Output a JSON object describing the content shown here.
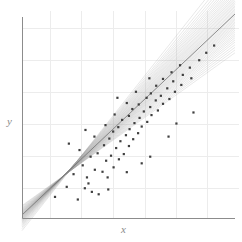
{
  "figure": {
    "background_color": "#ffffff",
    "width": 242,
    "height": 242
  },
  "axes": {
    "x_label": "x",
    "y_label": "y",
    "axis_color": "#8c8c8c",
    "axis_width": 1,
    "origin_px": [
      22,
      218
    ],
    "x_axis_end_px": [
      235,
      218
    ],
    "y_axis_top_px": [
      22,
      17
    ],
    "ticks_visible": false,
    "tick_labels_visible": false
  },
  "grid": {
    "visible": true,
    "color": "#ececec",
    "width": 1,
    "x_positions_px": [
      50,
      81,
      113,
      145,
      176,
      207
    ],
    "y_positions_px": [
      28,
      60,
      92,
      124,
      156,
      188
    ]
  },
  "chart_data": {
    "type": "scatter",
    "title": "",
    "subtitle": "",
    "xlabel": "x",
    "ylabel": "y",
    "xlim": [
      0,
      10
    ],
    "ylim": [
      0,
      10
    ],
    "grid": true,
    "legend": null,
    "annotations": [],
    "series": [
      {
        "name": "observations",
        "type": "scatter",
        "marker": "square",
        "marker_size_px": 2.2,
        "color": "#3f3f3f",
        "points": [
          [
            1.55,
            1.05
          ],
          [
            2.1,
            1.55
          ],
          [
            2.62,
            0.92
          ],
          [
            2.95,
            1.48
          ],
          [
            3.28,
            1.3
          ],
          [
            2.42,
            2.18
          ],
          [
            3.05,
            2.02
          ],
          [
            3.6,
            1.18
          ],
          [
            3.42,
            2.4
          ],
          [
            2.85,
            2.62
          ],
          [
            3.78,
            2.3
          ],
          [
            4.02,
            2.02
          ],
          [
            3.22,
            3.05
          ],
          [
            3.95,
            2.85
          ],
          [
            4.3,
            2.52
          ],
          [
            2.7,
            3.38
          ],
          [
            3.55,
            3.22
          ],
          [
            4.18,
            3.1
          ],
          [
            4.55,
            2.92
          ],
          [
            3.85,
            3.62
          ],
          [
            4.42,
            3.48
          ],
          [
            4.78,
            3.18
          ],
          [
            3.4,
            4.05
          ],
          [
            4.1,
            3.95
          ],
          [
            4.62,
            3.82
          ],
          [
            5.02,
            3.58
          ],
          [
            4.28,
            4.3
          ],
          [
            4.88,
            4.12
          ],
          [
            5.22,
            3.92
          ],
          [
            3.92,
            4.62
          ],
          [
            4.52,
            4.52
          ],
          [
            5.05,
            4.42
          ],
          [
            5.45,
            4.22
          ],
          [
            4.7,
            4.88
          ],
          [
            5.28,
            4.72
          ],
          [
            5.62,
            4.55
          ],
          [
            4.35,
            5.15
          ],
          [
            5.02,
            5.08
          ],
          [
            5.52,
            4.98
          ],
          [
            5.88,
            4.78
          ],
          [
            5.18,
            5.42
          ],
          [
            5.72,
            5.3
          ],
          [
            6.08,
            5.12
          ],
          [
            4.92,
            5.72
          ],
          [
            5.48,
            5.65
          ],
          [
            6.02,
            5.52
          ],
          [
            6.38,
            5.35
          ],
          [
            5.85,
            5.98
          ],
          [
            6.28,
            5.85
          ],
          [
            6.62,
            5.68
          ],
          [
            5.35,
            6.28
          ],
          [
            6.05,
            6.2
          ],
          [
            6.52,
            6.08
          ],
          [
            6.92,
            5.92
          ],
          [
            6.3,
            6.58
          ],
          [
            6.82,
            6.45
          ],
          [
            7.18,
            6.28
          ],
          [
            6.62,
            6.92
          ],
          [
            7.1,
            6.8
          ],
          [
            7.48,
            6.62
          ],
          [
            7.02,
            7.25
          ],
          [
            7.55,
            7.12
          ],
          [
            7.95,
            6.95
          ],
          [
            7.42,
            7.6
          ],
          [
            7.88,
            7.48
          ],
          [
            8.32,
            7.85
          ],
          [
            8.65,
            8.22
          ],
          [
            9.02,
            8.58
          ],
          [
            2.2,
            3.7
          ],
          [
            4.92,
            2.28
          ],
          [
            6.02,
            3.05
          ],
          [
            7.25,
            4.7
          ],
          [
            8.05,
            5.25
          ],
          [
            3.12,
            1.72
          ],
          [
            5.62,
            2.72
          ],
          [
            4.05,
            1.42
          ],
          [
            6.88,
            4.05
          ],
          [
            2.98,
            4.38
          ],
          [
            5.98,
            6.95
          ],
          [
            4.48,
            5.98
          ]
        ]
      },
      {
        "name": "posterior-regression-lines",
        "type": "line-bundle",
        "color": "#9a9a9a",
        "opacity": 0.38,
        "width": 0.6,
        "count": 44,
        "description": "Bundle of sampled regression lines converging near the lower-left and fanning out toward the upper right.",
        "pivot": [
          1.55,
          0.75
        ],
        "slopes": [
          0.76,
          0.778,
          0.795,
          0.812,
          0.828,
          0.842,
          0.856,
          0.868,
          0.88,
          0.892,
          0.903,
          0.914,
          0.924,
          0.934,
          0.944,
          0.953,
          0.962,
          0.971,
          0.98,
          0.989,
          0.998,
          1.006,
          1.015,
          1.024,
          1.033,
          1.042,
          1.051,
          1.061,
          1.071,
          1.081,
          1.092,
          1.103,
          1.115,
          1.128,
          1.141,
          1.155,
          1.17,
          1.186,
          1.204,
          1.223,
          1.245,
          1.27,
          1.3,
          1.338
        ],
        "intercepts": [
          0.62,
          0.58,
          0.54,
          0.5,
          0.47,
          0.44,
          0.41,
          0.39,
          0.36,
          0.34,
          0.32,
          0.3,
          0.28,
          0.26,
          0.24,
          0.22,
          0.21,
          0.19,
          0.17,
          0.16,
          0.14,
          0.12,
          0.11,
          0.09,
          0.07,
          0.06,
          0.04,
          0.02,
          0.0,
          -0.02,
          -0.04,
          -0.06,
          -0.09,
          -0.11,
          -0.14,
          -0.17,
          -0.2,
          -0.24,
          -0.28,
          -0.33,
          -0.38,
          -0.45,
          -0.53,
          -0.63
        ]
      },
      {
        "name": "mean-regression-line",
        "type": "line",
        "color": "#6f6f6f",
        "opacity": 0.85,
        "width": 0.9,
        "slope": 1.0,
        "intercept": 0.15
      }
    ]
  }
}
